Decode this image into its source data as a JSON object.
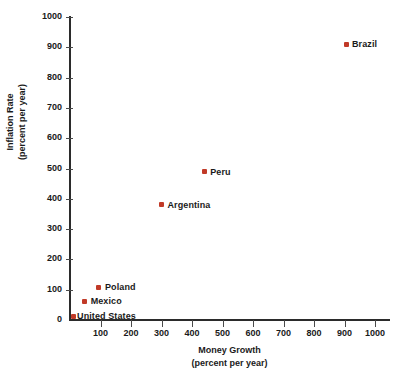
{
  "chart_data": {
    "type": "scatter",
    "title": "",
    "xlabel": "Money Growth",
    "xlabel_sub": "(percent per year)",
    "ylabel": "Inflation Rate",
    "ylabel_sub": "(percent per year)",
    "xlim": [
      0,
      1050
    ],
    "ylim": [
      0,
      1000
    ],
    "xticks": [
      0,
      100,
      200,
      300,
      400,
      500,
      600,
      700,
      800,
      900,
      1000
    ],
    "yticks": [
      0,
      100,
      200,
      300,
      400,
      500,
      600,
      700,
      800,
      900,
      1000
    ],
    "grid": false,
    "legend": "none",
    "marker_color": "#c13a28",
    "axis_color": "#2b2b2b",
    "points": [
      {
        "label": "Brazil",
        "x": 905,
        "y": 910
      },
      {
        "label": "Peru",
        "x": 440,
        "y": 490
      },
      {
        "label": "Argentina",
        "x": 300,
        "y": 380
      },
      {
        "label": "Poland",
        "x": 95,
        "y": 108
      },
      {
        "label": "Mexico",
        "x": 48,
        "y": 62
      },
      {
        "label": "United States",
        "x": 10,
        "y": 13
      }
    ]
  }
}
